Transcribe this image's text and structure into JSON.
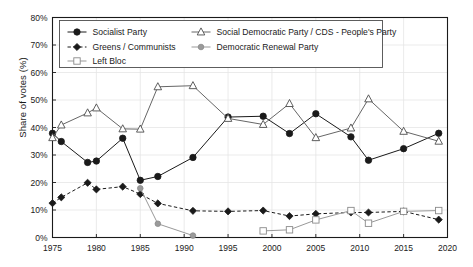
{
  "chart_data": {
    "type": "line",
    "title": "",
    "xlabel": "",
    "ylabel": "Share of votes (%)",
    "xlim": [
      1975,
      2020
    ],
    "ylim": [
      0,
      80
    ],
    "xticks": [
      "1975",
      "1980",
      "1985",
      "1990",
      "1995",
      "2000",
      "2005",
      "2010",
      "2015",
      "2020"
    ],
    "yticks": [
      "0%",
      "10%",
      "20%",
      "30%",
      "40%",
      "50%",
      "60%",
      "70%",
      "80%"
    ],
    "grid": true,
    "legend_position": "top-left-inside",
    "series": [
      {
        "name": "Socialist Party",
        "marker": "filled-circle",
        "line": "solid",
        "color": "#1a1a1a",
        "points": [
          [
            1975,
            37.9
          ],
          [
            1976,
            34.9
          ],
          [
            1979,
            27.3
          ],
          [
            1980,
            27.8
          ],
          [
            1983,
            36.1
          ],
          [
            1985,
            20.8
          ],
          [
            1987,
            22.2
          ],
          [
            1991,
            29.1
          ],
          [
            1995,
            43.8
          ],
          [
            1999,
            44.1
          ],
          [
            2002,
            37.8
          ],
          [
            2005,
            45.0
          ],
          [
            2009,
            36.6
          ],
          [
            2011,
            28.1
          ],
          [
            2015,
            32.3
          ],
          [
            2019,
            37.9
          ]
        ]
      },
      {
        "name": "Social Democratic Party / CDS - People's Party",
        "marker": "open-triangle",
        "line": "solid",
        "color": "#666666",
        "points": [
          [
            1975,
            36.3
          ],
          [
            1976,
            40.9
          ],
          [
            1979,
            45.3
          ],
          [
            1980,
            47.1
          ],
          [
            1983,
            39.5
          ],
          [
            1985,
            39.4
          ],
          [
            1987,
            54.8
          ],
          [
            1991,
            55.2
          ],
          [
            1995,
            43.3
          ],
          [
            1999,
            41.1
          ],
          [
            2002,
            48.7
          ],
          [
            2005,
            36.3
          ],
          [
            2009,
            39.8
          ],
          [
            2011,
            50.4
          ],
          [
            2015,
            38.6
          ],
          [
            2019,
            35.0
          ]
        ]
      },
      {
        "name": "Greens / Communists",
        "marker": "filled-diamond",
        "line": "dashed",
        "color": "#1a1a1a",
        "points": [
          [
            1975,
            12.5
          ],
          [
            1976,
            14.6
          ],
          [
            1979,
            19.9
          ],
          [
            1980,
            17.5
          ],
          [
            1983,
            18.5
          ],
          [
            1985,
            15.8
          ],
          [
            1987,
            12.4
          ],
          [
            1991,
            9.7
          ],
          [
            1995,
            9.5
          ],
          [
            1999,
            9.8
          ],
          [
            2002,
            7.8
          ],
          [
            2005,
            8.6
          ],
          [
            2009,
            9.1
          ],
          [
            2011,
            9.1
          ],
          [
            2015,
            9.5
          ],
          [
            2019,
            6.5
          ]
        ]
      },
      {
        "name": "Democratic Renewal Party",
        "marker": "filled-circle-gray",
        "line": "solid",
        "color": "#999999",
        "points": [
          [
            1985,
            17.9
          ],
          [
            1987,
            5.0
          ],
          [
            1991,
            0.7
          ]
        ]
      },
      {
        "name": "Left Bloc",
        "marker": "open-square",
        "line": "solid",
        "color": "#999999",
        "points": [
          [
            1999,
            2.4
          ],
          [
            2002,
            2.8
          ],
          [
            2005,
            6.4
          ],
          [
            2009,
            9.8
          ],
          [
            2011,
            5.2
          ],
          [
            2015,
            9.5
          ],
          [
            2019,
            9.8
          ]
        ]
      }
    ],
    "legend_entries": [
      "Socialist Party",
      "Social Democratic Party / CDS - People's Party",
      "Greens / Communists",
      "Democratic Renewal Party",
      "Left Bloc"
    ]
  }
}
